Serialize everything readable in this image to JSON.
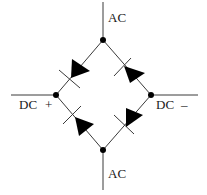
{
  "diagram": {
    "title": "",
    "type": "full-wave bridge rectifier",
    "colors": {
      "line": "#3a3a3a",
      "fill": "#000000",
      "background": "#ffffff"
    },
    "labels": {
      "ac_top": "AC",
      "ac_bottom": "AC",
      "dc_left": "DC",
      "dc_left_polarity": "+",
      "dc_right": "DC",
      "dc_right_polarity": "–"
    },
    "nodes": [
      {
        "id": "top",
        "role": "AC input"
      },
      {
        "id": "left",
        "role": "DC positive"
      },
      {
        "id": "right",
        "role": "DC negative"
      },
      {
        "id": "bottom",
        "role": "AC input"
      }
    ],
    "diodes": [
      {
        "id": "D1",
        "position": "upper-left"
      },
      {
        "id": "D2",
        "position": "upper-right"
      },
      {
        "id": "D3",
        "position": "lower-left"
      },
      {
        "id": "D4",
        "position": "lower-right"
      }
    ]
  }
}
